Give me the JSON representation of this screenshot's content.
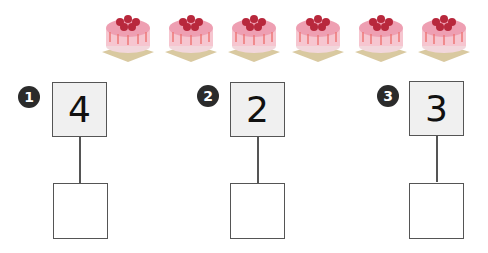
{
  "cakes": {
    "count": 6,
    "icon": "cake-icon"
  },
  "problems": [
    {
      "badge": "1",
      "number": "4",
      "answer": ""
    },
    {
      "badge": "2",
      "number": "2",
      "answer": ""
    },
    {
      "badge": "3",
      "number": "3",
      "answer": ""
    }
  ],
  "colors": {
    "badge": "#2b2b2b",
    "box_fill": "#f0f0f0",
    "border": "#555555",
    "cake_pink": "#e88aa0",
    "cake_berry": "#b8283c"
  }
}
